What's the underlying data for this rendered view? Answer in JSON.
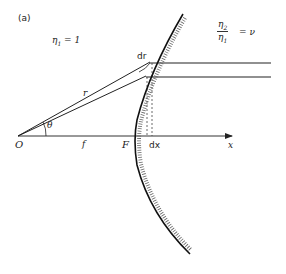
{
  "figure": {
    "panel_label": "(a)",
    "medium1": {
      "symbol": "η",
      "sub": "1",
      "value_text": "= 1"
    },
    "ratio": {
      "num_symbol": "η",
      "num_sub": "2",
      "den_symbol": "η",
      "den_sub": "1",
      "rhs": "= ν"
    },
    "labels": {
      "origin": "O",
      "focal_length": "f",
      "focus": "F",
      "dx": "dx",
      "x_axis": "x",
      "radius": "r",
      "angle": "θ",
      "dr": "dr"
    },
    "colors": {
      "ink": "#222222",
      "hatch": "#555555",
      "background": "#ffffff"
    }
  }
}
